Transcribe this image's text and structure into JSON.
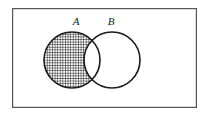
{
  "figure": {
    "kind": "venn-diagram",
    "title": "",
    "background_color": "#ffffff",
    "stroke_color": "#1a1a1a",
    "shaded_region_description": "A minus B",
    "universe": {
      "shape": "rectangle",
      "label": "",
      "x": 12,
      "y": 8,
      "width": 185,
      "height": 100,
      "stroke_color": "#555555",
      "stroke_width": 1.2,
      "fill_color": "#ffffff"
    },
    "sets": [
      {
        "id": "A",
        "label": "A",
        "label_x": 76,
        "label_y": 25,
        "cx": 72,
        "cy": 60,
        "r": 28,
        "stroke_color": "#1a1a1a",
        "stroke_width": 1.6,
        "fill_color": "#ffffff",
        "shaded": true
      },
      {
        "id": "B",
        "label": "B",
        "label_x": 111,
        "label_y": 25,
        "cx": 112,
        "cy": 60,
        "r": 28,
        "stroke_color": "#1a1a1a",
        "stroke_width": 1.6,
        "fill_color": "#ffffff",
        "shaded": false
      }
    ],
    "hatch": {
      "style": "crosshatch-grid",
      "spacing": 2.6,
      "line_width": 1.0,
      "line_color": "#111111",
      "fill_color": "#ffffff"
    }
  }
}
